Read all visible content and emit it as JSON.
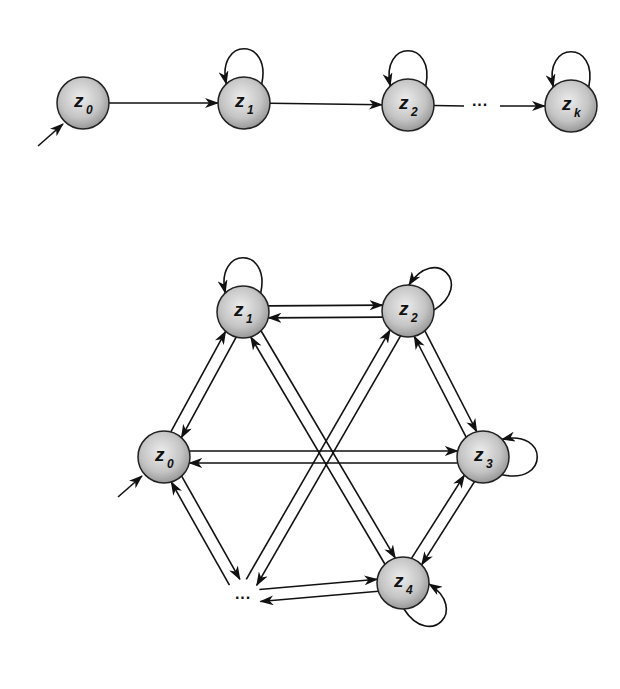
{
  "diagrams": [
    {
      "name": "left-to-right-chain",
      "nodes": [
        {
          "id": "t0",
          "label": "z",
          "sub": "0",
          "x": 83,
          "y": 103
        },
        {
          "id": "t1",
          "label": "z",
          "sub": "1",
          "x": 244,
          "y": 103
        },
        {
          "id": "t2",
          "label": "z",
          "sub": "2",
          "x": 408,
          "y": 105
        },
        {
          "id": "tk",
          "label": "z",
          "sub": "k",
          "x": 571,
          "y": 106
        }
      ],
      "ellipses": [
        {
          "text": "···",
          "x": 480,
          "y": 110
        }
      ],
      "initial": {
        "from": [
          38,
          146
        ],
        "to": [
          63,
          124
        ]
      },
      "edges": [
        {
          "from": "t0",
          "to": "t1"
        },
        {
          "from": "t1",
          "to": "t2"
        },
        {
          "from": "t2",
          "to": [
            464,
            106
          ],
          "arrow": false
        },
        {
          "from": [
            500,
            106
          ],
          "to": "tk"
        }
      ],
      "self_loops": [
        {
          "node": "t1",
          "side": "top"
        },
        {
          "node": "t2",
          "side": "top"
        },
        {
          "node": "tk",
          "side": "top"
        }
      ]
    },
    {
      "name": "fully-connected-hexagon",
      "nodes": [
        {
          "id": "h1",
          "label": "z",
          "sub": "1",
          "x": 243,
          "y": 312
        },
        {
          "id": "h2",
          "label": "z",
          "sub": "2",
          "x": 408,
          "y": 311
        },
        {
          "id": "h0",
          "label": "z",
          "sub": "0",
          "x": 164,
          "y": 457
        },
        {
          "id": "h3",
          "label": "z",
          "sub": "3",
          "x": 483,
          "y": 457
        },
        {
          "id": "h4",
          "label": "z",
          "sub": "4",
          "x": 403,
          "y": 583
        },
        {
          "id": "hd",
          "label": "",
          "sub": "",
          "x": 243,
          "y": 597,
          "ellipsis": true
        }
      ],
      "ellipses": [
        {
          "text": "···",
          "x": 243,
          "y": 603
        }
      ],
      "initial": {
        "from": [
          118,
          497
        ],
        "to": [
          142,
          476
        ]
      },
      "edge_pairs": [
        [
          "h1",
          "h2"
        ],
        [
          "h0",
          "h1"
        ],
        [
          "h0",
          "h3"
        ],
        [
          "h2",
          "h3"
        ],
        [
          "h3",
          "h4"
        ],
        [
          "hd",
          "h4"
        ],
        [
          "h0",
          "hd"
        ],
        [
          "h1",
          "h4"
        ],
        [
          "h2",
          "hd"
        ]
      ],
      "self_loops": [
        {
          "node": "h1",
          "side": "top"
        },
        {
          "node": "h2",
          "side": "top-right"
        },
        {
          "node": "h3",
          "side": "right"
        },
        {
          "node": "h4",
          "side": "bottom-right"
        }
      ]
    }
  ],
  "style": {
    "node_radius": 26,
    "node_fill_light": "#e6e6e6",
    "node_fill_dark": "#9a9a9a",
    "node_stroke": "#222222",
    "edge_color": "#111111"
  }
}
